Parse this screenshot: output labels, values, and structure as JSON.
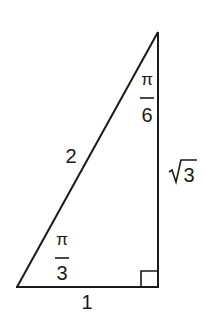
{
  "figure": {
    "colors": {
      "stroke": "#1a1a1a",
      "background": "#ffffff"
    },
    "vertices": {
      "top": [
        158,
        32
      ],
      "bottom_left": [
        17,
        287
      ],
      "bottom_right": [
        158,
        287
      ]
    },
    "sides": {
      "hypotenuse": "2",
      "base": "1",
      "vertical_radicand": "3"
    },
    "angles": {
      "top": {
        "numerator": "π",
        "denominator": "6"
      },
      "bottom_left": {
        "numerator": "π",
        "denominator": "3"
      }
    },
    "right_angle_marker": "bottom_right"
  }
}
